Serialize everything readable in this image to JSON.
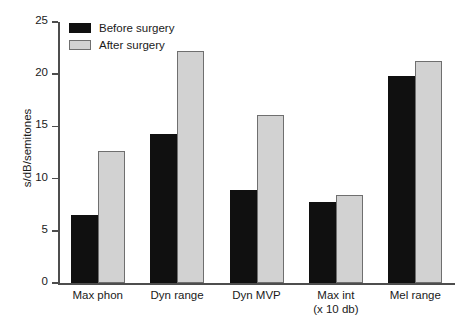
{
  "chart_data": {
    "type": "bar",
    "title": "",
    "xlabel": "",
    "ylabel": "s/dB/semitones",
    "ylim": [
      0,
      25
    ],
    "yticks": [
      0,
      5,
      10,
      15,
      20,
      25
    ],
    "grid": false,
    "legend_position": "top-left",
    "categories": [
      "Max phon",
      "Dyn range",
      "Dyn MVP",
      "Max int (x 10 db)",
      "Mel range"
    ],
    "category_lines": [
      [
        "Max phon"
      ],
      [
        "Dyn range"
      ],
      [
        "Dyn MVP"
      ],
      [
        "Max int",
        "(x 10 db)"
      ],
      [
        "Mel range"
      ]
    ],
    "series": [
      {
        "name": "Before surgery",
        "color": "#101010",
        "values": [
          6.5,
          14.3,
          8.9,
          7.8,
          19.8
        ]
      },
      {
        "name": "After surgery",
        "color": "#d2d2d2",
        "values": [
          12.6,
          22.2,
          16.1,
          8.4,
          21.3
        ]
      }
    ]
  },
  "legend": {
    "items": [
      {
        "label": "Before surgery"
      },
      {
        "label": "After surgery"
      }
    ]
  },
  "axis": {
    "y_label": "s/dB/semitones",
    "tick_labels": [
      "0",
      "5",
      "10",
      "15",
      "20",
      "25"
    ]
  }
}
